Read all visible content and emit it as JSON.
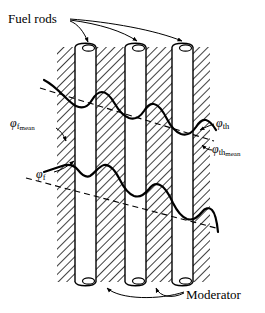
{
  "figure": {
    "labels": {
      "fuel_rods": "Fuel rods",
      "moderator": "Moderator",
      "phi_symbol": "φ",
      "fast_flux_sub": "f",
      "thermal_flux_sub": "th",
      "mean_sub": "mean"
    },
    "colors": {
      "ink": "#000000",
      "background": "#ffffff",
      "rod_fill": "#ffffff",
      "hatch": "#000000"
    }
  },
  "geometry": {
    "slab": {
      "x": 57,
      "y": 47,
      "width": 153,
      "height": 235
    },
    "rods": [
      {
        "name": "rod-1",
        "x": 75,
        "width": 21
      },
      {
        "name": "rod-2",
        "x": 125,
        "width": 21
      },
      {
        "name": "rod-3",
        "x": 172,
        "width": 21
      }
    ],
    "rod_top": 47,
    "rod_bottom": 282,
    "cap_ry": 5
  },
  "chart_data": {
    "type": "line",
    "xlabel": "",
    "ylabel": "",
    "grid": false,
    "legend": "inline-annotations",
    "annotations": [
      {
        "name": "phi-th",
        "text": "φth",
        "meaning": "thermal neutron flux"
      },
      {
        "name": "phi-th-mean",
        "text": "φth mean",
        "meaning": "mean thermal neutron flux"
      },
      {
        "name": "phi-f",
        "text": "φf",
        "meaning": "fast neutron flux"
      },
      {
        "name": "phi-f-mean",
        "text": "φf mean",
        "meaning": "mean fast neutron flux"
      }
    ],
    "series": [
      {
        "name": "phi-th",
        "label": "φth",
        "style": "solid",
        "description": "Thermal flux: dips inside fuel rods (absorption), peaks in moderator channels; overall declining trend left to right",
        "points": "M44,80 C52,84 58,90 64,96 C68,100 72,104 76,106 C82,109 88,107 92,100 C95,95 98,92 102,92 C107,92 111,97 115,104 C119,111 124,116 129,118 C135,120 140,117 144,111 C147,106 150,103 154,104 C159,105 163,111 167,119 C171,127 176,132 181,134 C187,136 192,133 196,127 C199,122 202,119 206,120 C210,121 213,125 216,130"
      },
      {
        "name": "phi-th-mean",
        "label": "φth mean",
        "style": "dashed",
        "description": "Mean thermal flux: straight dashed line sloping gently downward to the right",
        "points": "M40,88 L214,141"
      },
      {
        "name": "phi-f",
        "label": "φf",
        "style": "solid",
        "description": "Fast flux: peaks inside fuel rods (fission source), dips in moderator; overall declining trend left to right",
        "points": "M44,172 C50,170 56,168 62,166 C68,164 73,164 78,170 C82,175 86,178 90,176 C95,173 99,166 104,165 C110,164 115,170 120,180 C124,188 129,194 134,196 C140,198 145,194 149,189 C152,185 156,183 160,185 C165,187 169,194 173,203 C177,211 182,217 187,219 C193,221 198,217 202,212 C205,208 209,207 212,210 C215,213 217,222 218,232"
      },
      {
        "name": "phi-f-mean",
        "label": "φf mean",
        "style": "dashed",
        "description": "Mean fast flux: straight dashed line sloping gently downward to the right",
        "points": "M26,178 L216,228"
      }
    ]
  }
}
